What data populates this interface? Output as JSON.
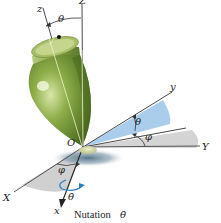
{
  "diagram": {
    "caption": {
      "text": "Nutation",
      "symbol": "θ̇"
    },
    "axes": {
      "fixed": [
        {
          "name": "X",
          "label": "X"
        },
        {
          "name": "Y",
          "label": "Y"
        },
        {
          "name": "Z",
          "label": "Z"
        }
      ],
      "body": [
        {
          "name": "x",
          "label": "x"
        },
        {
          "name": "y",
          "label": "y"
        },
        {
          "name": "z",
          "label": "z"
        }
      ]
    },
    "origin_label": "O",
    "angles": {
      "theta_top": "θ",
      "theta_right": "θ",
      "phi_right": "φ",
      "phi_left": "φ",
      "theta_dot": "θ̇"
    },
    "colors": {
      "top_body": "#7a9a3c",
      "top_dark": "#4f6e22",
      "plane_blue": "#a9cdea",
      "plane_gray": "#d4d4d4",
      "shadow": "#5f7f95",
      "line": "#333333",
      "rotation_arrow": "#2f7fbf"
    }
  }
}
